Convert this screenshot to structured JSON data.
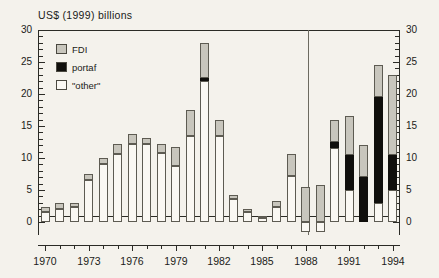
{
  "chart_data": {
    "type": "bar",
    "title": "US$ (1999) billions",
    "subtitle": "",
    "xlabel": "",
    "ylabel": "US$ (1999) billions",
    "stacked": true,
    "grid": false,
    "legend_position": "top-left",
    "ylim": [
      -2,
      30
    ],
    "ytick_major": [
      0,
      5,
      10,
      15,
      20,
      25,
      30
    ],
    "ytick_labels": [
      "0",
      "5",
      "10",
      "15",
      "20",
      "25",
      "30"
    ],
    "ytick_minor_step": 1,
    "dual_y_axis": true,
    "xlim": [
      1969.4,
      1994.6
    ],
    "xtick_labels": [
      "1970",
      "1973",
      "1976",
      "1979",
      "1982",
      "1985",
      "1988",
      "1991",
      "1994"
    ],
    "xtick_values": [
      1970,
      1973,
      1976,
      1979,
      1982,
      1985,
      1988,
      1991,
      1994
    ],
    "annotations": [
      {
        "type": "vertical-line",
        "x": 1988.5,
        "label": ""
      }
    ],
    "legend": [
      {
        "name": "FDI",
        "color": "#c8c6bd"
      },
      {
        "name": "portaf",
        "color": "#100f0c"
      },
      {
        "name": "\"other\"",
        "color": "#faf8f3"
      }
    ],
    "categories": [
      1970,
      1971,
      1972,
      1973,
      1974,
      1975,
      1976,
      1977,
      1978,
      1979,
      1980,
      1981,
      1982,
      1983,
      1984,
      1985,
      1986,
      1987,
      1988,
      1989,
      1990,
      1991,
      1992,
      1993,
      1994
    ],
    "series": [
      {
        "name": "\"other\"",
        "color": "#faf8f3",
        "values": [
          1.6,
          2.0,
          2.4,
          6.6,
          9.0,
          10.6,
          12.2,
          12.2,
          10.8,
          8.8,
          13.4,
          22.1,
          13.4,
          3.6,
          1.5,
          0.7,
          2.3,
          7.2,
          -1.5,
          -1.5,
          11.5,
          5.0,
          0.0,
          3.0,
          5.0
        ]
      },
      {
        "name": "portaf",
        "color": "#100f0c",
        "values": [
          0.0,
          0.0,
          0.0,
          0.0,
          0.0,
          0.0,
          0.0,
          0.0,
          0.0,
          0.0,
          0.0,
          0.4,
          0.0,
          0.0,
          0.0,
          0.0,
          0.0,
          0.0,
          0.0,
          0.0,
          1.0,
          5.5,
          7.0,
          16.5,
          5.5
        ]
      },
      {
        "name": "FDI",
        "color": "#c8c6bd",
        "values": [
          0.8,
          0.9,
          0.6,
          0.9,
          1.0,
          1.6,
          1.5,
          0.9,
          1.4,
          3.0,
          4.1,
          5.4,
          2.6,
          0.7,
          0.5,
          0.3,
          1.0,
          3.4,
          5.4,
          5.8,
          3.5,
          6.0,
          5.0,
          5.0,
          12.5
        ]
      }
    ],
    "bar_totals": [
      2.4,
      2.9,
      3.0,
      7.5,
      10.0,
      12.2,
      13.7,
      13.1,
      12.2,
      11.8,
      17.5,
      27.9,
      16.0,
      4.3,
      2.0,
      1.0,
      3.3,
      10.6,
      3.9,
      4.3,
      16.0,
      16.5,
      12.0,
      24.5,
      23.0
    ]
  }
}
